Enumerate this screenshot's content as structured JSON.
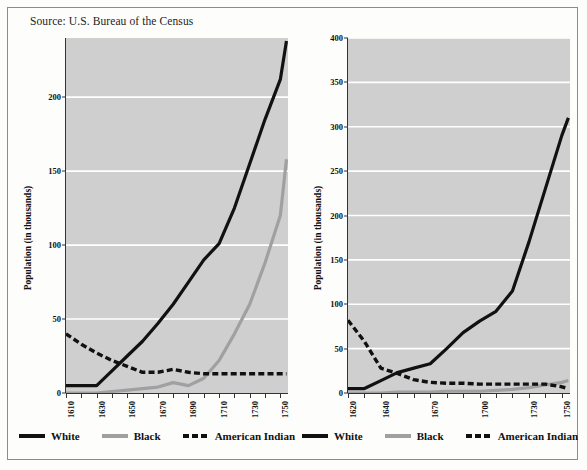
{
  "source_note": "Source: U.S. Bureau of the Census",
  "legend": {
    "items": [
      {
        "label": "White",
        "style": "solid-black",
        "color": "#111111"
      },
      {
        "label": "Black",
        "style": "solid-gray",
        "color": "#a0a0a0"
      },
      {
        "label": "American Indian",
        "style": "dashed-black",
        "color": "#111111"
      }
    ]
  },
  "chart_data": [
    {
      "id": "virginia-maryland",
      "type": "line",
      "title": "",
      "xlabel": "",
      "ylabel": "Population (in thousands)",
      "xlim": [
        1610,
        1755
      ],
      "ylim": [
        0,
        240
      ],
      "yticks": [
        0,
        50,
        100,
        150,
        200
      ],
      "xticks": [
        1610,
        1630,
        1650,
        1670,
        1690,
        1710,
        1730,
        1750
      ],
      "xtick_minor_step": 10,
      "grid": "horizontal",
      "plot_background": "#cfcfcf",
      "gridline_color": "#ffffff",
      "legend_position": "bottom",
      "series": [
        {
          "name": "White",
          "color": "#111111",
          "dash": "solid",
          "x": [
            1610,
            1620,
            1630,
            1640,
            1650,
            1660,
            1670,
            1680,
            1690,
            1700,
            1710,
            1720,
            1730,
            1740,
            1750,
            1754
          ],
          "values": [
            5,
            5,
            5,
            15,
            25,
            35,
            47,
            60,
            75,
            90,
            101,
            125,
            155,
            185,
            212,
            238
          ]
        },
        {
          "name": "Black",
          "color": "#a0a0a0",
          "dash": "solid",
          "x": [
            1610,
            1620,
            1630,
            1640,
            1650,
            1660,
            1670,
            1680,
            1690,
            1700,
            1710,
            1720,
            1730,
            1740,
            1750,
            1754
          ],
          "values": [
            0,
            0,
            0,
            1,
            2,
            3,
            4,
            7,
            5,
            10,
            22,
            40,
            60,
            88,
            120,
            158
          ]
        },
        {
          "name": "American Indian",
          "color": "#111111",
          "dash": "dashed",
          "x": [
            1610,
            1620,
            1630,
            1640,
            1650,
            1660,
            1670,
            1680,
            1690,
            1700,
            1710,
            1720,
            1730,
            1740,
            1750,
            1754
          ],
          "values": [
            40,
            33,
            27,
            22,
            18,
            14,
            14,
            16,
            14,
            13,
            13,
            13,
            13,
            13,
            13,
            13
          ]
        }
      ]
    },
    {
      "id": "new-england",
      "type": "line",
      "title": "",
      "xlabel": "",
      "ylabel": "Population (in thousands)",
      "xlim": [
        1620,
        1755
      ],
      "ylim": [
        0,
        400
      ],
      "yticks": [
        0,
        50,
        100,
        150,
        200,
        250,
        300,
        350,
        400
      ],
      "xticks": [
        1620,
        1640,
        1670,
        1700,
        1730,
        1750
      ],
      "xtick_minor_step": 10,
      "grid": "horizontal",
      "plot_background": "#cfcfcf",
      "gridline_color": "#ffffff",
      "legend_position": "bottom",
      "series": [
        {
          "name": "White",
          "color": "#111111",
          "dash": "solid",
          "x": [
            1620,
            1630,
            1640,
            1650,
            1660,
            1670,
            1680,
            1690,
            1700,
            1710,
            1720,
            1730,
            1740,
            1750,
            1754
          ],
          "values": [
            5,
            5,
            14,
            23,
            28,
            33,
            50,
            68,
            81,
            92,
            115,
            170,
            230,
            290,
            310
          ]
        },
        {
          "name": "Black",
          "color": "#a0a0a0",
          "dash": "solid",
          "x": [
            1620,
            1630,
            1640,
            1650,
            1660,
            1670,
            1680,
            1690,
            1700,
            1710,
            1720,
            1730,
            1740,
            1750,
            1754
          ],
          "values": [
            0,
            0,
            0,
            1,
            1,
            1,
            2,
            2,
            2,
            3,
            4,
            6,
            9,
            12,
            14
          ]
        },
        {
          "name": "American Indian",
          "color": "#111111",
          "dash": "dashed",
          "x": [
            1620,
            1630,
            1640,
            1650,
            1660,
            1670,
            1680,
            1690,
            1700,
            1710,
            1720,
            1730,
            1740,
            1750,
            1754
          ],
          "values": [
            82,
            58,
            28,
            22,
            15,
            12,
            11,
            11,
            10,
            10,
            10,
            10,
            10,
            7,
            5
          ]
        }
      ]
    }
  ]
}
